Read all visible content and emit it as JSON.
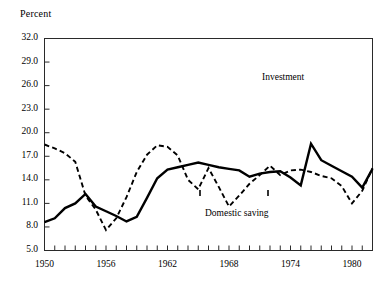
{
  "chart_data": {
    "type": "line",
    "title": "",
    "ylabel": "Percent",
    "xlabel": "",
    "ylim": [
      5.0,
      32.0
    ],
    "xlim": [
      1950,
      1982
    ],
    "grid": false,
    "legend_position": "inline-annotation",
    "y_ticks": [
      "32.0",
      "29.0",
      "26.0",
      "23.0",
      "20.0",
      "17.0",
      "14.0",
      "11.0",
      "8.0",
      "5.0"
    ],
    "y_tick_values": [
      32.0,
      29.0,
      26.0,
      23.0,
      20.0,
      17.0,
      14.0,
      11.0,
      8.0,
      5.0
    ],
    "x_ticks": [
      "1950",
      "1956",
      "1962",
      "1968",
      "1974",
      "1980"
    ],
    "x_tick_values": [
      1950,
      1956,
      1962,
      1968,
      1974,
      1980
    ],
    "x_minor_step": 1,
    "x": [
      1950,
      1951,
      1952,
      1953,
      1954,
      1955,
      1956,
      1957,
      1958,
      1959,
      1960,
      1961,
      1962,
      1963,
      1964,
      1965,
      1966,
      1967,
      1968,
      1969,
      1970,
      1971,
      1972,
      1973,
      1974,
      1975,
      1976,
      1977,
      1978,
      1979,
      1980,
      1981,
      1982
    ],
    "series": [
      {
        "name": "Investment",
        "style": "solid",
        "color": "#000000",
        "annotation": "Investment",
        "values": [
          8.6,
          9.1,
          10.4,
          11.0,
          12.2,
          10.6,
          10.0,
          9.4,
          8.7,
          9.3,
          11.7,
          14.2,
          15.3,
          15.6,
          15.9,
          16.2,
          15.9,
          15.6,
          15.4,
          15.2,
          14.4,
          14.8,
          15.0,
          15.1,
          14.3,
          13.3,
          18.6,
          16.5,
          15.8,
          15.1,
          14.4,
          13.0,
          15.4
        ]
      },
      {
        "name": "Domestic saving",
        "style": "dashed",
        "color": "#000000",
        "annotation": "Domestic saving",
        "values": [
          18.5,
          18.0,
          17.4,
          16.3,
          12.0,
          10.2,
          7.6,
          9.1,
          11.8,
          15.0,
          17.2,
          18.4,
          18.2,
          17.1,
          14.0,
          12.8,
          15.5,
          13.1,
          10.6,
          12.0,
          13.5,
          14.6,
          15.8,
          14.6,
          15.2,
          15.3,
          15.0,
          14.5,
          14.2,
          13.2,
          11.0,
          12.6,
          15.5
        ]
      }
    ]
  },
  "annotations": {
    "investment": "Investment",
    "domestic_saving": "Domestic saving"
  }
}
